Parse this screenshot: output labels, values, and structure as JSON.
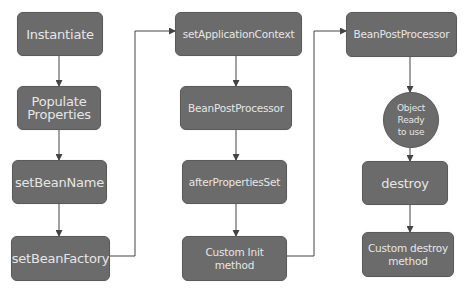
{
  "diagram": {
    "colors": {
      "node_fill": "#6b6b6b",
      "node_text": "#e6e6e6",
      "edge": "#444444",
      "background": "#ffffff"
    },
    "nodes": [
      {
        "id": "instantiate",
        "label": "Instantiate",
        "shape": "rounded-rect",
        "x": 17,
        "y": 12,
        "w": 86,
        "h": 44,
        "big": true
      },
      {
        "id": "populate",
        "label": "Populate\nProperties",
        "shape": "rounded-rect",
        "x": 17,
        "y": 86,
        "w": 84,
        "h": 44,
        "big": true
      },
      {
        "id": "setBeanName",
        "label": "setBeanName",
        "shape": "rounded-rect",
        "x": 12,
        "y": 160,
        "w": 95,
        "h": 44,
        "big": true
      },
      {
        "id": "setBeanFactory",
        "label": "setBeanFactory",
        "shape": "rounded-rect",
        "x": 11,
        "y": 236,
        "w": 99,
        "h": 45,
        "big": true
      },
      {
        "id": "setApplicationContext",
        "label": "setApplicationContext",
        "shape": "rounded-rect",
        "x": 175,
        "y": 12,
        "w": 127,
        "h": 44,
        "big": false
      },
      {
        "id": "bpp1",
        "label": "BeanPostProcessor",
        "shape": "rounded-rect",
        "x": 180,
        "y": 86,
        "w": 112,
        "h": 44,
        "big": false
      },
      {
        "id": "afterPropertiesSet",
        "label": "afterPropertiesSet",
        "shape": "rounded-rect",
        "x": 182,
        "y": 160,
        "w": 105,
        "h": 44,
        "big": false
      },
      {
        "id": "customInit",
        "label": "Custom Init\nmethod",
        "shape": "rounded-rect",
        "x": 182,
        "y": 236,
        "w": 105,
        "h": 45,
        "big": false
      },
      {
        "id": "bpp2",
        "label": "BeanPostProcessor",
        "shape": "rounded-rect",
        "x": 346,
        "y": 12,
        "w": 111,
        "h": 45,
        "big": false
      },
      {
        "id": "objectReady",
        "label": "Object\nReady\nto use",
        "shape": "circle",
        "x": 383,
        "y": 92,
        "w": 56,
        "h": 56,
        "big": false
      },
      {
        "id": "destroy",
        "label": "destroy",
        "shape": "rounded-rect",
        "x": 362,
        "y": 161,
        "w": 86,
        "h": 44,
        "big": true
      },
      {
        "id": "customDestroy",
        "label": "Custom destroy\nmethod",
        "shape": "rounded-rect",
        "x": 362,
        "y": 232,
        "w": 92,
        "h": 45,
        "big": false
      }
    ],
    "edges": [
      {
        "from": "instantiate",
        "to": "populate",
        "points": "59,56 59,86"
      },
      {
        "from": "populate",
        "to": "setBeanName",
        "points": "59,130 59,160"
      },
      {
        "from": "setBeanName",
        "to": "setBeanFactory",
        "points": "59,204 59,236"
      },
      {
        "from": "setBeanFactory",
        "to": "setApplicationContext",
        "points": "110,256 135,256 135,31 175,31"
      },
      {
        "from": "setApplicationContext",
        "to": "bpp1",
        "points": "236,56 236,86"
      },
      {
        "from": "bpp1",
        "to": "afterPropertiesSet",
        "points": "236,130 236,160"
      },
      {
        "from": "afterPropertiesSet",
        "to": "customInit",
        "points": "236,204 236,236"
      },
      {
        "from": "customInit",
        "to": "bpp2",
        "points": "287,256 314,256 314,31 346,31"
      },
      {
        "from": "bpp2",
        "to": "objectReady",
        "points": "410,57 410,92"
      },
      {
        "from": "objectReady",
        "to": "destroy",
        "points": "410,148 410,161"
      },
      {
        "from": "destroy",
        "to": "customDestroy",
        "points": "410,205 410,232"
      }
    ]
  }
}
